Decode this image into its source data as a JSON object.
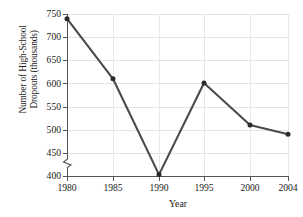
{
  "chart_data": {
    "type": "line",
    "title": "",
    "xlabel": "Year",
    "ylabel": "Number of High-School Dropouts (thousands)",
    "ylabel_lines": [
      "Number of High-School",
      "Dropouts (thousands)"
    ],
    "categories": [
      "1980",
      "1985",
      "1990",
      "1995",
      "2000",
      "2004"
    ],
    "x": [
      1980,
      1985,
      1990,
      1995,
      2000,
      2004
    ],
    "values": [
      740,
      610,
      403,
      601,
      510,
      490
    ],
    "series": [
      {
        "name": "High-school dropouts",
        "values": [
          740,
          610,
          403,
          601,
          510,
          490
        ]
      }
    ],
    "ylim": [
      400,
      750
    ],
    "yticks": [
      400,
      450,
      500,
      550,
      600,
      650,
      700,
      750
    ],
    "ytick_labels": [
      "400",
      "450",
      "500",
      "550",
      "600",
      "650",
      "700",
      "750"
    ],
    "xticks": [
      1980,
      1985,
      1990,
      1995,
      2000,
      2004
    ],
    "xtick_labels": [
      "1980",
      "1985",
      "1990",
      "1995",
      "2000",
      "2004"
    ],
    "grid": true,
    "legend": false,
    "legend_position": "none",
    "axis_break_y": true,
    "line_color": "#4a4a4a",
    "marker": "circle",
    "marker_color": "#2a2a2a",
    "background_color": "#ffffff",
    "grid_color": "#e3e3e3",
    "axis_color": "#555555"
  }
}
